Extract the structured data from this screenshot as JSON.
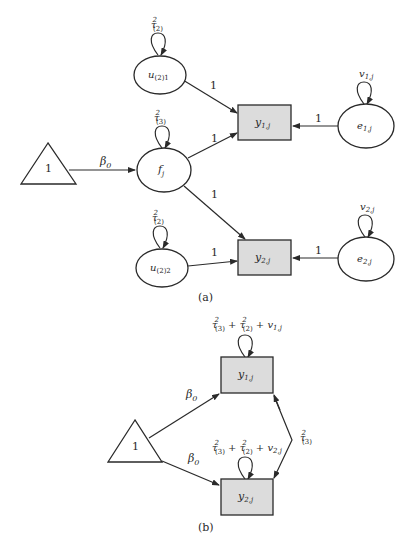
{
  "diagram_a": {
    "caption": "(a)",
    "nodes": {
      "u21": {
        "base": "u",
        "sub": "(2)1",
        "variance": {
          "base": "τ",
          "sup": "2",
          "sub": "(2)"
        }
      },
      "fj": {
        "base": "f",
        "sub": "j",
        "variance": {
          "base": "τ",
          "sup": "2",
          "sub": "(3)"
        }
      },
      "u22": {
        "base": "u",
        "sub": "(2)2",
        "variance": {
          "base": "τ",
          "sup": "2",
          "sub": "(2)"
        }
      },
      "y1": {
        "base": "y",
        "sub": "1,j"
      },
      "y2": {
        "base": "y",
        "sub": "2,j"
      },
      "e1": {
        "base": "e",
        "sub": "1,j",
        "variance": {
          "base": "v",
          "sub": "1,j"
        }
      },
      "e2": {
        "base": "e",
        "sub": "2,j",
        "variance": {
          "base": "v",
          "sub": "2,j"
        }
      },
      "const": {
        "label": "1"
      }
    },
    "edges": {
      "const_f": {
        "base": "β",
        "sub": "0"
      },
      "u21_y1": "1",
      "f_y1": "1",
      "f_y2": "1",
      "u22_y2": "1",
      "e1_y1": "1",
      "e2_y2": "1"
    }
  },
  "diagram_b": {
    "caption": "(b)",
    "nodes": {
      "const": {
        "label": "1"
      },
      "y1": {
        "base": "y",
        "sub": "1,j",
        "variance": {
          "t1": "τ",
          "t1sup": "2",
          "t1sub": "(3)",
          "plus1": " + ",
          "t2": "τ",
          "t2sup": "2",
          "t2sub": "(2)",
          "plus2": " + ",
          "t3": "v",
          "t3sub": "1,j"
        }
      },
      "y2": {
        "base": "y",
        "sub": "2,j",
        "variance": {
          "t1": "τ",
          "t1sup": "2",
          "t1sub": "(3)",
          "plus1": " + ",
          "t2": "τ",
          "t2sup": "2",
          "t2sub": "(2)",
          "plus2": " + ",
          "t3": "v",
          "t3sub": "2,j"
        }
      }
    },
    "edges": {
      "const_y1": {
        "base": "β",
        "sub": "0"
      },
      "const_y2": {
        "base": "β",
        "sub": "0"
      },
      "cov_y1_y2": {
        "base": "τ",
        "sup": "2",
        "sub": "(3)"
      }
    }
  },
  "colors": {
    "stroke": "#2a2a2a",
    "box_fill": "#dcdcdc",
    "background": "#ffffff"
  }
}
